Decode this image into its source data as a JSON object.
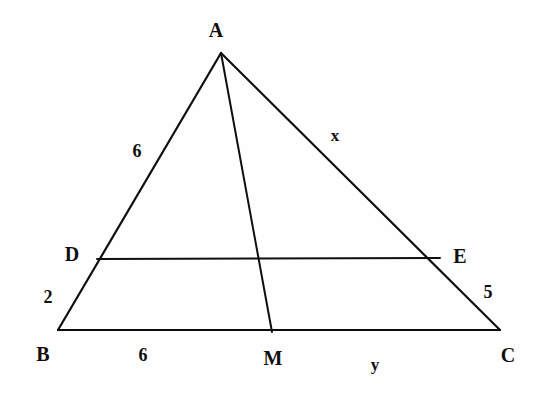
{
  "figure": {
    "background_color": "#fefefe",
    "stroke_color": "#100f0f",
    "stroke_width": 2.2,
    "canvas": {
      "width": 535,
      "height": 394
    }
  },
  "points": {
    "A": {
      "name": "A",
      "x": 221,
      "y": 53
    },
    "B": {
      "name": "B",
      "x": 58,
      "y": 330
    },
    "C": {
      "name": "C",
      "x": 500,
      "y": 330
    },
    "D": {
      "name": "D",
      "x": 97,
      "y": 259
    },
    "E": {
      "name": "E",
      "x": 440,
      "y": 258
    },
    "M": {
      "name": "M",
      "x": 272,
      "y": 332
    }
  },
  "segments": [
    {
      "name": "side-AB",
      "from": "A",
      "to": "B"
    },
    {
      "name": "side-AC",
      "from": "A",
      "to": "C"
    },
    {
      "name": "base-BC",
      "from": "B",
      "to": "C"
    },
    {
      "name": "cevian-AM",
      "from": "A",
      "to": "M"
    },
    {
      "name": "segment-DE",
      "from": "D",
      "to": "E"
    }
  ],
  "vertex_labels": [
    {
      "id": "label-A",
      "text": "A",
      "x": 216,
      "y": 30
    },
    {
      "id": "label-B",
      "text": "B",
      "x": 43,
      "y": 354
    },
    {
      "id": "label-C",
      "text": "C",
      "x": 508,
      "y": 355
    },
    {
      "id": "label-D",
      "text": "D",
      "x": 72,
      "y": 254
    },
    {
      "id": "label-E",
      "text": "E",
      "x": 460,
      "y": 256
    },
    {
      "id": "label-M",
      "text": "M",
      "x": 273,
      "y": 358
    }
  ],
  "measure_labels": [
    {
      "id": "length-AD",
      "text": "6",
      "segment": "AD",
      "x": 137,
      "y": 151
    },
    {
      "id": "length-DB",
      "text": "2",
      "segment": "DB",
      "x": 48,
      "y": 297
    },
    {
      "id": "length-BM",
      "text": "6",
      "segment": "BM",
      "x": 143,
      "y": 355
    },
    {
      "id": "length-EC",
      "text": "5",
      "segment": "EC",
      "x": 488,
      "y": 292
    }
  ],
  "variable_labels": [
    {
      "id": "variable-x",
      "text": "x",
      "segment": "AE",
      "x": 335,
      "y": 135
    },
    {
      "id": "variable-y",
      "text": "y",
      "segment": "MC",
      "x": 375,
      "y": 364
    }
  ]
}
